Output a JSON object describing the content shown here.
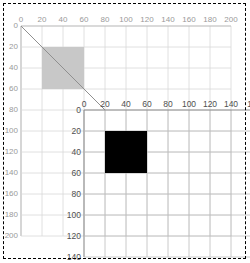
{
  "figure": {
    "title": ""
  },
  "colors": {
    "background": "#ffffff",
    "page_border": "#000000",
    "outer_grid": "#d8d8d8",
    "outer_axis": "#b5b5b5",
    "outer_tick_text": "#9a9a9a",
    "inner_grid": "#bdbdbd",
    "inner_axis": "#8c8c8c",
    "inner_tick_text": "#4f4f4f",
    "gray_square_fill": "#c8c8c8",
    "black_square_fill": "#000000",
    "diagonal_line": "#8f8f8f"
  },
  "chart_data": {
    "type": "scatter",
    "title": "",
    "xlabel": "",
    "ylabel": "",
    "grid": true,
    "legend": null,
    "coordinate_systems": [
      {
        "name": "outer",
        "origin_px": [
          21,
          26
        ],
        "pixels_per_unit": 1.05,
        "x_axis": {
          "direction": "right",
          "range": [
            0,
            200
          ],
          "tick_step": 20,
          "ticks": [
            0,
            20,
            40,
            60,
            80,
            100,
            120,
            140,
            160,
            180,
            200
          ],
          "tick_labels": [
            "0",
            "20",
            "40",
            "60",
            "80",
            "100",
            "120",
            "140",
            "160",
            "180",
            "200"
          ],
          "label_position": "top"
        },
        "y_axis": {
          "direction": "down",
          "range": [
            0,
            200
          ],
          "tick_step": 20,
          "ticks": [
            0,
            20,
            40,
            60,
            80,
            100,
            120,
            140,
            160,
            180,
            200
          ],
          "tick_labels": [
            "0",
            "20",
            "40",
            "60",
            "80",
            "100",
            "120",
            "140",
            "160",
            "180",
            "200"
          ],
          "label_position": "left"
        },
        "shapes": [
          {
            "name": "gray-square",
            "type": "rect",
            "x": 20,
            "y": 20,
            "width": 40,
            "height": 40,
            "fill": "#c8c8c8",
            "stroke": "none"
          },
          {
            "name": "diagonal-connector",
            "type": "line",
            "x1": 0,
            "y1": 0,
            "x2": 80,
            "y2": 80,
            "stroke": "#8f8f8f",
            "stroke_width": 1
          }
        ]
      },
      {
        "name": "inner",
        "origin_outer_units": [
          80,
          80
        ],
        "origin_px": [
          84,
          110
        ],
        "pixels_per_unit": 1.05,
        "x_axis": {
          "direction": "right",
          "range": [
            0,
            160
          ],
          "tick_step": 20,
          "ticks": [
            0,
            20,
            40,
            60,
            80,
            100,
            120,
            140,
            160
          ],
          "tick_labels": [
            "0",
            "20",
            "40",
            "60",
            "80",
            "100",
            "120",
            "140",
            "16"
          ],
          "label_position": "top",
          "clipped_right": true
        },
        "y_axis": {
          "direction": "down",
          "range": [
            0,
            140
          ],
          "tick_step": 20,
          "ticks": [
            0,
            20,
            40,
            60,
            80,
            100,
            120,
            140
          ],
          "tick_labels": [
            "0",
            "20",
            "40",
            "60",
            "80",
            "100",
            "120",
            "140"
          ],
          "label_position": "left",
          "clipped_bottom": true
        },
        "shapes": [
          {
            "name": "black-square",
            "type": "rect",
            "x": 20,
            "y": 20,
            "width": 40,
            "height": 40,
            "fill": "#000000",
            "stroke": "none"
          }
        ]
      }
    ]
  }
}
